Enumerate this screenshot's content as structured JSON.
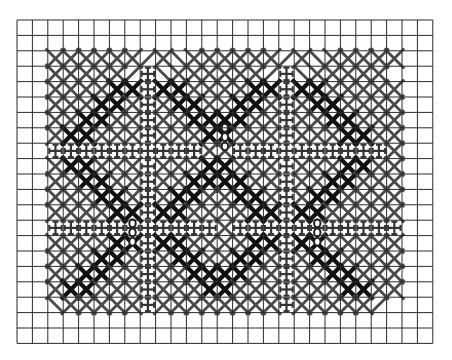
{
  "grid": {
    "columns": 27,
    "rows": 21
  },
  "colors": {
    "background": "#ffffff",
    "grid_line": "#2a2a2a",
    "stitch_light": "#4a4a4a",
    "stitch_dark": "#111111",
    "motif": "#333333",
    "bead": "#222222"
  },
  "legend": {
    ".": "empty",
    "x": "cross stitch (medium)",
    "X": "cross stitch (dark)",
    "+": "cross motif",
    "/": "half stitch rising",
    "\\": "half stitch falling"
  },
  "pattern": [
    "...........................",
    "...........................",
    "..xxxxxx/x\\xxxxxx/x\\xxxxx..",
    "..xxxxx/+\\xxxxxx/+\\xxxxx...",
    "..xxxxXX+XXxxxxXX+XXxxxxx..",
    "..xxxXXx+xXXxxXXx+xXXxxxx..",
    "..xxXXxx+xxXXXXxx+xxXXxxx..",
    "..xXXxxx+xxxXXxxx+xxxXXxx..",
    "..++++++++++xx++++++++++x..",
    "..xXXxxx+xxxXXxxx+xxxXXxx..",
    "..xxXXxx+xxXXXXxx+xxXXxxx..",
    "..xxxXXx+xXXxxXXx+xXXxxxx..",
    "..xxxxXX+XXxxxxXX+XXxxxxx..",
    "..+++++++++++x+++++++++++..",
    "..xxxxXX+XXxxxxXX+XXxxxxx..",
    "..xxxXXx+xXXxxXXx+xXXxxxx..",
    "..xxXXxx+xxXXXXxx+xxXXxxx..",
    "..xXXxxx+xxxXXxxx+xxxXXxx..",
    "..\\xxxxx+xxxxxxxx+xxxxx/...",
    "...........................",
    "..........................."
  ],
  "beads": [
    {
      "col": 13,
      "row": 6.5
    },
    {
      "col": 13,
      "row": 7.1
    },
    {
      "col": 13,
      "row": 7.7
    },
    {
      "col": 7,
      "row": 12.7
    },
    {
      "col": 7,
      "row": 13.3
    },
    {
      "col": 7,
      "row": 13.9
    },
    {
      "col": 19,
      "row": 12.7
    },
    {
      "col": 19,
      "row": 13.3
    },
    {
      "col": 19,
      "row": 13.9
    }
  ]
}
